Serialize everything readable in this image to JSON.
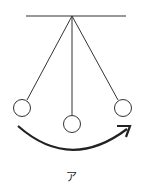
{
  "diagram": {
    "type": "pendulum",
    "caption": "ア",
    "support_bar": {
      "x1": 26,
      "x2": 126,
      "y": 16
    },
    "pivot": {
      "x": 72,
      "y": 16
    },
    "bobs": [
      {
        "name": "left",
        "cx": 22,
        "cy": 108,
        "r": 8.5
      },
      {
        "name": "center",
        "cx": 72,
        "cy": 124,
        "r": 8.5
      },
      {
        "name": "right",
        "cx": 123,
        "cy": 108,
        "r": 8.5
      }
    ],
    "arrow": {
      "direction": "left-to-right",
      "path": "M18 126 Q70 172 128 128"
    },
    "colors": {
      "stroke": "#333333"
    }
  }
}
